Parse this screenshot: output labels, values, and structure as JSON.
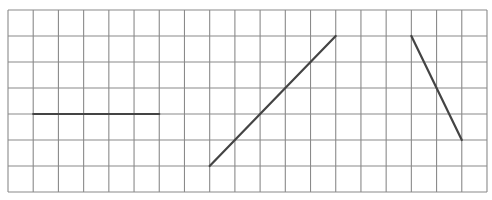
{
  "grid": {
    "origin_x": 8,
    "origin_y": 10,
    "cols": 19,
    "rows": 7,
    "cell_w": 25.21,
    "cell_h": 26,
    "line_color": "#8a8a8a",
    "line_width": 1.1
  },
  "segments": [
    {
      "name": "horizontal-segment",
      "from": [
        1,
        4
      ],
      "to": [
        6,
        4
      ]
    },
    {
      "name": "rising-diagonal-segment",
      "from": [
        8,
        6
      ],
      "to": [
        13,
        1
      ]
    },
    {
      "name": "steep-falling-segment",
      "from": [
        16,
        1
      ],
      "to": [
        18,
        5
      ]
    }
  ],
  "segment_style": {
    "color": "#444444",
    "width": 2.2
  }
}
